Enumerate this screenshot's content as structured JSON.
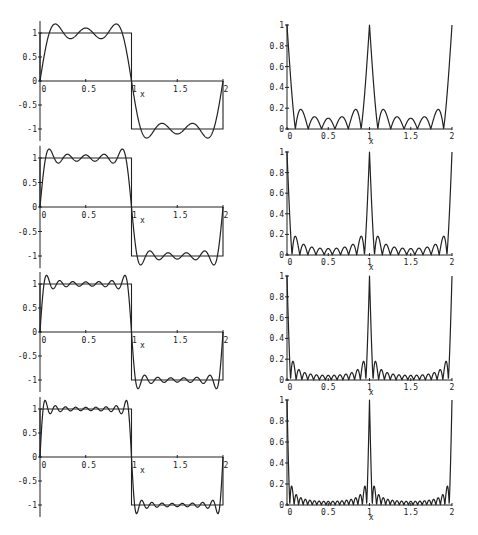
{
  "figure": {
    "x_axis_label": "x"
  },
  "chart_data": [
    {
      "type": "line",
      "panel": "left-1",
      "title": "",
      "xlabel": "x",
      "ylabel": "",
      "xlim": [
        0,
        2
      ],
      "ylim": [
        -1.2,
        1.2
      ],
      "x_ticks": [
        "0",
        "0.5",
        "1",
        "1.5",
        "2"
      ],
      "y_ticks": [
        "-1",
        "-0.5",
        "0",
        "0.5",
        "1"
      ],
      "series": [
        {
          "name": "square wave",
          "x": [
            0,
            0,
            1,
            1,
            2,
            2
          ],
          "values": [
            0,
            1,
            1,
            -1,
            -1,
            0
          ]
        },
        {
          "name": "Fourier partial sum",
          "terms": 3,
          "x": [
            0,
            0.1,
            0.17,
            0.25,
            0.33,
            0.42,
            0.5,
            0.58,
            0.67,
            0.75,
            0.83,
            0.9,
            1.0
          ],
          "values": [
            0,
            0.92,
            1.13,
            1.0,
            0.9,
            1.05,
            1.07,
            1.05,
            0.9,
            1.0,
            1.13,
            0.92,
            0
          ]
        }
      ]
    },
    {
      "type": "line",
      "panel": "right-1",
      "title": "",
      "xlabel": "x",
      "ylabel": "",
      "xlim": [
        0,
        2
      ],
      "ylim": [
        0,
        1
      ],
      "x_ticks": [
        "0",
        "0.5",
        "1",
        "1.5",
        "2"
      ],
      "y_ticks": [
        "0",
        "0.2",
        "0.4",
        "0.6",
        "0.8",
        "1"
      ],
      "series": [
        {
          "name": "absolute error",
          "terms": 3,
          "x": [
            0,
            0.07,
            0.13,
            0.2,
            0.3,
            0.4,
            0.5,
            0.6,
            0.7,
            0.8,
            0.87,
            0.93,
            1.0
          ],
          "values": [
            1.0,
            0.02,
            0.18,
            0.0,
            0.11,
            0.0,
            0.1,
            0.0,
            0.11,
            0.0,
            0.18,
            0.02,
            1.0
          ]
        }
      ]
    },
    {
      "type": "line",
      "panel": "left-2",
      "title": "",
      "xlabel": "x",
      "ylabel": "",
      "xlim": [
        0,
        2
      ],
      "ylim": [
        -1.2,
        1.2
      ],
      "x_ticks": [
        "0",
        "0.5",
        "1",
        "1.5",
        "2"
      ],
      "y_ticks": [
        "-1",
        "-0.5",
        "0",
        "0.5",
        "1"
      ],
      "series": [
        {
          "name": "square wave",
          "x": [
            0,
            0,
            1,
            1,
            2,
            2
          ],
          "values": [
            0,
            1,
            1,
            -1,
            -1,
            0
          ]
        },
        {
          "name": "Fourier partial sum",
          "terms": 5,
          "x": [
            0,
            0.06,
            0.1,
            0.5,
            0.9,
            0.94,
            1.0
          ],
          "values": [
            0,
            0.95,
            1.17,
            1.0,
            1.17,
            0.95,
            0
          ]
        }
      ]
    },
    {
      "type": "line",
      "panel": "right-2",
      "title": "",
      "xlabel": "x",
      "ylabel": "",
      "xlim": [
        0,
        2
      ],
      "ylim": [
        0,
        1
      ],
      "x_ticks": [
        "0",
        "0.5",
        "1",
        "1.5",
        "2"
      ],
      "y_ticks": [
        "0",
        "0.2",
        "0.4",
        "0.6",
        "0.8",
        "1"
      ],
      "series": [
        {
          "name": "absolute error",
          "terms": 5,
          "x": [
            0,
            0.05,
            0.09,
            0.5,
            0.91,
            0.95,
            1.0
          ],
          "values": [
            1.0,
            0.02,
            0.18,
            0.06,
            0.18,
            0.02,
            1.0
          ]
        }
      ]
    },
    {
      "type": "line",
      "panel": "left-3",
      "title": "",
      "xlabel": "x",
      "ylabel": "",
      "xlim": [
        0,
        2
      ],
      "ylim": [
        -1.2,
        1.2
      ],
      "x_ticks": [
        "0",
        "0.5",
        "1",
        "1.5",
        "2"
      ],
      "y_ticks": [
        "-1",
        "-0.5",
        "0",
        "0.5",
        "1"
      ],
      "series": [
        {
          "name": "square wave",
          "x": [
            0,
            0,
            1,
            1,
            2,
            2
          ],
          "values": [
            0,
            1,
            1,
            -1,
            -1,
            0
          ]
        },
        {
          "name": "Fourier partial sum",
          "terms": 7,
          "x": [
            0,
            0.04,
            0.07,
            0.5,
            0.93,
            0.96,
            1.0
          ],
          "values": [
            0,
            0.95,
            1.18,
            1.0,
            1.18,
            0.95,
            0
          ]
        }
      ]
    },
    {
      "type": "line",
      "panel": "right-3",
      "title": "",
      "xlabel": "x",
      "ylabel": "",
      "xlim": [
        0,
        2
      ],
      "ylim": [
        0,
        1
      ],
      "x_ticks": [
        "0",
        "0.5",
        "1",
        "1.5",
        "2"
      ],
      "y_ticks": [
        "0",
        "0.2",
        "0.4",
        "0.6",
        "0.8",
        "1"
      ],
      "series": [
        {
          "name": "absolute error",
          "terms": 7,
          "x": [
            0,
            0.035,
            0.065,
            0.5,
            0.935,
            0.965,
            1.0
          ],
          "values": [
            1.0,
            0.02,
            0.18,
            0.04,
            0.18,
            0.02,
            1.0
          ]
        }
      ]
    },
    {
      "type": "line",
      "panel": "left-4",
      "title": "",
      "xlabel": "x",
      "ylabel": "",
      "xlim": [
        0,
        2
      ],
      "ylim": [
        -1.2,
        1.2
      ],
      "x_ticks": [
        "0",
        "0.5",
        "1",
        "1.5",
        "2"
      ],
      "y_ticks": [
        "-1",
        "-0.5",
        "0",
        "0.5",
        "1"
      ],
      "series": [
        {
          "name": "square wave",
          "x": [
            0,
            0,
            1,
            1,
            2,
            2
          ],
          "values": [
            0,
            1,
            1,
            -1,
            -1,
            0
          ]
        },
        {
          "name": "Fourier partial sum",
          "terms": 9,
          "x": [
            0,
            0.03,
            0.055,
            0.5,
            0.945,
            0.97,
            1.0
          ],
          "values": [
            0,
            0.95,
            1.18,
            1.0,
            1.18,
            0.95,
            0
          ]
        }
      ]
    },
    {
      "type": "line",
      "panel": "right-4",
      "title": "",
      "xlabel": "x",
      "ylabel": "",
      "xlim": [
        0,
        2
      ],
      "ylim": [
        0,
        1
      ],
      "x_ticks": [
        "0",
        "0.5",
        "1",
        "1.5",
        "2"
      ],
      "y_ticks": [
        "0",
        "0.2",
        "0.4",
        "0.6",
        "0.8",
        "1"
      ],
      "series": [
        {
          "name": "absolute error",
          "terms": 9,
          "x": [
            0,
            0.028,
            0.05,
            0.5,
            0.95,
            0.972,
            1.0
          ],
          "values": [
            1.0,
            0.02,
            0.18,
            0.03,
            0.18,
            0.02,
            1.0
          ]
        }
      ]
    }
  ],
  "layout": {
    "left_panels": [
      {
        "x0": 40,
        "x2": 223,
        "y_pos1": 33,
        "y_zero": 81,
        "y_neg1": 129
      },
      {
        "x0": 40,
        "x2": 223,
        "y_pos1": 158,
        "y_zero": 207,
        "y_neg1": 255
      },
      {
        "x0": 40,
        "x2": 223,
        "y_pos1": 284,
        "y_zero": 332,
        "y_neg1": 380
      },
      {
        "x0": 40,
        "x2": 223,
        "y_pos1": 409,
        "y_zero": 457,
        "y_neg1": 505
      }
    ],
    "right_panels": [
      {
        "x0": 287,
        "x2": 452,
        "y_one": 25,
        "y_zero": 129
      },
      {
        "x0": 287,
        "x2": 452,
        "y_one": 152,
        "y_zero": 255
      },
      {
        "x0": 287,
        "x2": 452,
        "y_one": 276,
        "y_zero": 380
      },
      {
        "x0": 287,
        "x2": 452,
        "y_one": 400,
        "y_zero": 505
      }
    ],
    "terms": [
      3,
      5,
      7,
      9
    ]
  }
}
